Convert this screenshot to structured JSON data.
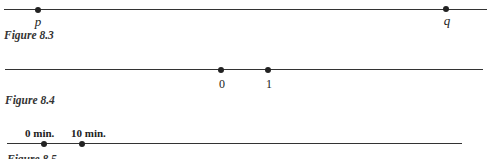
{
  "figures": [
    {
      "caption": "Figure 8.3",
      "points": [
        {
          "label": "p"
        },
        {
          "label": "q"
        }
      ]
    },
    {
      "caption": "Figure 8.4",
      "points": [
        {
          "label": "0"
        },
        {
          "label": "1"
        }
      ]
    },
    {
      "caption": "Figure 8.5",
      "points": [
        {
          "label": "0 min."
        },
        {
          "label": "10 min."
        }
      ]
    }
  ]
}
